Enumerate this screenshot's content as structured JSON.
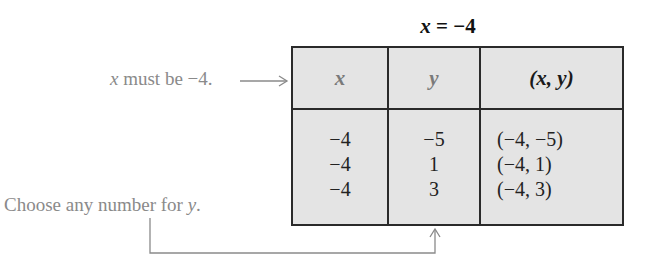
{
  "title": {
    "var": "x",
    "rest": " = −4"
  },
  "table": {
    "headers": [
      {
        "label": "x",
        "color": "#7a7a7a"
      },
      {
        "label": "y",
        "color": "#7a7a7a"
      },
      {
        "label": "(x, y)",
        "color": "#1a1a1a"
      }
    ],
    "rows": [
      {
        "x": "−4",
        "y": "−5",
        "pair": "(−4, −5)"
      },
      {
        "x": "−4",
        "y": "1",
        "pair": "(−4, 1)"
      },
      {
        "x": "−4",
        "y": "3",
        "pair": "(−4, 3)"
      }
    ]
  },
  "annotations": {
    "x_note": {
      "var": "x",
      "text": " must be −4."
    },
    "y_note": {
      "text": "Choose any number for ",
      "var": "y",
      "end": "."
    }
  }
}
